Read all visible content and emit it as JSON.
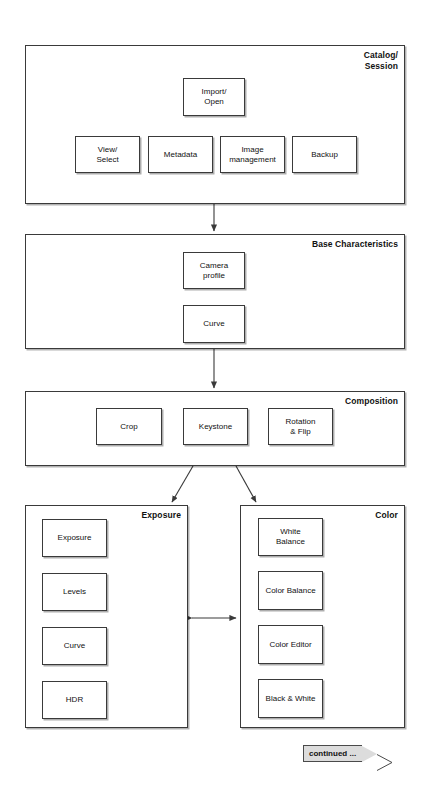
{
  "diagram": {
    "stroke_color": "#3a3a3a",
    "background": "#ffffff",
    "banner_fill": "#dcdcdc"
  },
  "sections": [
    {
      "id": "catalog-session",
      "label": "Catalog/\nSession",
      "nodes": [
        {
          "id": "import-open",
          "label": "Import/\nOpen"
        },
        {
          "id": "view-select",
          "label": "View/\nSelect"
        },
        {
          "id": "metadata",
          "label": "Metadata"
        },
        {
          "id": "image-management",
          "label": "Image\nmanagement"
        },
        {
          "id": "backup",
          "label": "Backup"
        }
      ]
    },
    {
      "id": "base-characteristics",
      "label": "Base Characteristics",
      "nodes": [
        {
          "id": "camera-profile",
          "label": "Camera\nprofile"
        },
        {
          "id": "base-curve",
          "label": "Curve"
        }
      ]
    },
    {
      "id": "composition",
      "label": "Composition",
      "nodes": [
        {
          "id": "crop",
          "label": "Crop"
        },
        {
          "id": "keystone",
          "label": "Keystone"
        },
        {
          "id": "rotation-flip",
          "label": "Rotation\n& Flip"
        }
      ]
    },
    {
      "id": "exposure",
      "label": "Exposure",
      "nodes": [
        {
          "id": "exposure-node",
          "label": "Exposure"
        },
        {
          "id": "levels",
          "label": "Levels"
        },
        {
          "id": "exp-curve",
          "label": "Curve"
        },
        {
          "id": "hdr",
          "label": "HDR"
        }
      ]
    },
    {
      "id": "color",
      "label": "Color",
      "nodes": [
        {
          "id": "white-balance",
          "label": "White\nBalance"
        },
        {
          "id": "color-balance",
          "label": "Color Balance"
        },
        {
          "id": "color-editor",
          "label": "Color Editor"
        },
        {
          "id": "black-white",
          "label": "Black & White"
        }
      ]
    }
  ],
  "footer": {
    "continued_label": "continued ..."
  }
}
